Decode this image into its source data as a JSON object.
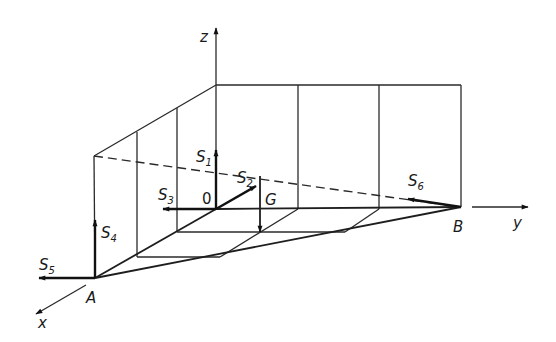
{
  "figure": {
    "axes": {
      "x": "x",
      "y": "y",
      "z": "z"
    },
    "points": {
      "origin": "0",
      "A": "A",
      "B": "B",
      "G": "G"
    },
    "forces": [
      {
        "id": "S1",
        "base": "S",
        "sub": "1"
      },
      {
        "id": "S2",
        "base": "S",
        "sub": "2"
      },
      {
        "id": "S3",
        "base": "S",
        "sub": "3"
      },
      {
        "id": "S4",
        "base": "S",
        "sub": "4"
      },
      {
        "id": "S5",
        "base": "S",
        "sub": "5"
      },
      {
        "id": "S6",
        "base": "S",
        "sub": "6"
      }
    ]
  }
}
